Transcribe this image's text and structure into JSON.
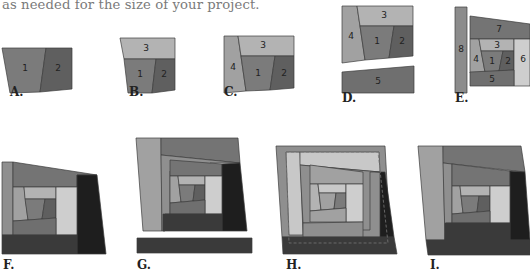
{
  "intro_text": "as needed for the size of your project.",
  "colors": {
    "p1": "#7b7b7b",
    "p2": "#5f5f5f",
    "p3": "#b3b3b3",
    "p4": "#a1a1a1",
    "p5": "#6f6f6f",
    "p6": "#cecece",
    "p7": "#747474",
    "p8": "#8c8c8c",
    "light": "#c8c8c8",
    "mid": "#8f8f8f",
    "dark": "#3a3a3a",
    "darker": "#1e1e1e",
    "edge": "#3c3c3c"
  },
  "figures": [
    {
      "id": "A",
      "label": "A.",
      "label_x": 10,
      "label_y": 97,
      "shapes": [
        {
          "pts": "2,48 46,48 40,92 10,93",
          "fill": "p1",
          "num": "1",
          "nx": 25,
          "ny": 71
        },
        {
          "pts": "46,48 72,48 72,89 40,92",
          "fill": "p2",
          "num": "2",
          "nx": 58,
          "ny": 71
        }
      ]
    },
    {
      "id": "B",
      "label": "B.",
      "label_x": 129,
      "label_y": 97,
      "shapes": [
        {
          "pts": "120,38 175,38 175,59 124,59",
          "fill": "p3",
          "num": "3",
          "nx": 146,
          "ny": 51
        },
        {
          "pts": "124,59 156,59 152,93 128,93",
          "fill": "p1",
          "num": "1",
          "nx": 140,
          "ny": 77
        },
        {
          "pts": "156,59 175,59 175,90 152,93",
          "fill": "p2",
          "num": "2",
          "nx": 164,
          "ny": 77
        }
      ]
    },
    {
      "id": "C",
      "label": "C.",
      "label_x": 224,
      "label_y": 97,
      "shapes": [
        {
          "pts": "224,36 238,36 246,91 224,93",
          "fill": "p4",
          "num": "4",
          "nx": 233,
          "ny": 70
        },
        {
          "pts": "238,36 294,36 294,56 241,56",
          "fill": "p3",
          "num": "3",
          "nx": 263,
          "ny": 48
        },
        {
          "pts": "241,56 275,56 270,90 246,91",
          "fill": "p1",
          "num": "1",
          "nx": 258,
          "ny": 76
        },
        {
          "pts": "275,56 294,56 294,88 270,90",
          "fill": "p2",
          "num": "2",
          "nx": 284,
          "ny": 76
        }
      ]
    },
    {
      "id": "D",
      "label": "D.",
      "label_x": 342,
      "label_y": 103,
      "shapes": [
        {
          "pts": "342,6 357,6 365,60 342,63",
          "fill": "p4",
          "num": "4",
          "nx": 351,
          "ny": 39
        },
        {
          "pts": "357,6 413,6 413,26 360,26",
          "fill": "p3",
          "num": "3",
          "nx": 384,
          "ny": 18
        },
        {
          "pts": "360,26 394,26 389,58 365,60",
          "fill": "p1",
          "num": "1",
          "nx": 377,
          "ny": 44
        },
        {
          "pts": "394,26 413,26 413,56 389,58",
          "fill": "p2",
          "num": "2",
          "nx": 402,
          "ny": 44
        },
        {
          "pts": "342,72 414,66 414,93 342,93",
          "fill": "p5",
          "num": "5",
          "nx": 378,
          "ny": 84
        }
      ]
    },
    {
      "id": "E",
      "label": "E.",
      "label_x": 455,
      "label_y": 103,
      "shapes": [
        {
          "pts": "455,7 467,7 467,93 455,93",
          "fill": "p8",
          "num": "8",
          "nx": 461,
          "ny": 52
        },
        {
          "pts": "470,16 530,24 530,39 470,39",
          "fill": "p7",
          "num": "7",
          "nx": 499,
          "ny": 32
        },
        {
          "pts": "470,39 479,39 485,72 470,73",
          "fill": "p4",
          "num": "4",
          "nx": 476,
          "ny": 62
        },
        {
          "pts": "479,39 514,39 514,51 481,51",
          "fill": "p3",
          "num": "3",
          "nx": 497,
          "ny": 48
        },
        {
          "pts": "481,51 503,51 499,71 485,72",
          "fill": "p1",
          "num": "1",
          "nx": 492,
          "ny": 64
        },
        {
          "pts": "503,51 514,51 514,70 499,71",
          "fill": "p2",
          "num": "2",
          "nx": 508,
          "ny": 64
        },
        {
          "pts": "514,39 530,39 530,86 514,86",
          "fill": "p6",
          "num": "6",
          "nx": 523,
          "ny": 62
        },
        {
          "pts": "470,72 514,70 514,86 470,86",
          "fill": "p5",
          "num": "5",
          "nx": 492,
          "ny": 82
        }
      ]
    },
    {
      "id": "F",
      "label": "F.",
      "label_x": 3,
      "label_y": 270,
      "shapes": [
        {
          "pts": "2,162 13,162 13,235 2,235",
          "fill": "mid"
        },
        {
          "pts": "13,162 97,175 77,175 77,187 13,187",
          "fill": "p7"
        },
        {
          "pts": "77,175 97,175 106,254 77,254",
          "fill": "darker"
        },
        {
          "pts": "13,187 24,187 28,220 13,221",
          "fill": "p4"
        },
        {
          "pts": "24,187 56,187 56,199 25,199",
          "fill": "p3"
        },
        {
          "pts": "25,199 45,199 42,219 28,220",
          "fill": "p1"
        },
        {
          "pts": "45,199 56,199 56,218 42,219",
          "fill": "p2"
        },
        {
          "pts": "56,187 77,187 77,235 56,235",
          "fill": "p6"
        },
        {
          "pts": "13,221 56,218 56,235 13,235",
          "fill": "p5"
        },
        {
          "pts": "2,235 77,235 77,254 2,254",
          "fill": "dark"
        }
      ]
    },
    {
      "id": "G",
      "label": "G.",
      "label_x": 137,
      "label_y": 270,
      "shapes": [
        {
          "pts": "136,138 161,138 162,231 143,231",
          "fill": "p4"
        },
        {
          "pts": "161,138 238,138 240,163 161,155",
          "fill": "p7"
        },
        {
          "pts": "161,155 240,163 210,163 210,171 170,171 170,214 165,214 165,231 162,231",
          "fill": "mid"
        },
        {
          "pts": "170,160 222,164 222,176 170,176",
          "fill": "p7"
        },
        {
          "pts": "222,164 240,163 247,231 222,231",
          "fill": "darker"
        },
        {
          "pts": "170,176 178,176 181,202 170,203",
          "fill": "p4"
        },
        {
          "pts": "178,176 205,176 205,185 179,185",
          "fill": "p3"
        },
        {
          "pts": "179,185 195,185 193,201 181,202",
          "fill": "p1"
        },
        {
          "pts": "195,185 205,185 205,200 193,201",
          "fill": "p2"
        },
        {
          "pts": "205,176 222,176 222,214 205,214",
          "fill": "p6"
        },
        {
          "pts": "170,203 205,200 205,214 170,214",
          "fill": "p5"
        },
        {
          "pts": "163,214 222,214 222,231 163,231",
          "fill": "dark"
        },
        {
          "pts": "137,238 252,238 252,253 137,253",
          "fill": "dark"
        }
      ]
    },
    {
      "id": "H",
      "label": "H.",
      "label_x": 286,
      "label_y": 270,
      "shapes": [
        {
          "pts": "276,146 385,146 390,237 282,237",
          "fill": "mid"
        },
        {
          "pts": "286,152 300,152 303,235 289,235",
          "fill": "light"
        },
        {
          "pts": "300,152 379,152 380,172 300,165",
          "fill": "light"
        },
        {
          "pts": "300,165 380,172 370,172 370,230 310,230 310,223 303,223",
          "fill": "mid"
        },
        {
          "pts": "310,165 363,172 363,184 310,184",
          "fill": "p4"
        },
        {
          "pts": "310,184 318,184 321,210 310,211",
          "fill": "p3"
        },
        {
          "pts": "318,184 346,184 346,193 319,193",
          "fill": "light"
        },
        {
          "pts": "319,193 336,193 334,209 321,210",
          "fill": "p4"
        },
        {
          "pts": "336,193 346,193 346,208 334,209",
          "fill": "p1"
        },
        {
          "pts": "346,184 363,184 363,222 346,222",
          "fill": "p6"
        },
        {
          "pts": "310,211 346,208 346,222 310,222",
          "fill": "p4"
        },
        {
          "pts": "303,223 363,222 363,237 303,237",
          "fill": "mid"
        },
        {
          "pts": "380,172 385,172 394,237 380,237",
          "fill": "darker"
        },
        {
          "pts": "282,237 394,237 397,254 283,254",
          "fill": "dark"
        }
      ],
      "dashed": "286,152 378,152 388,243 289,243"
    },
    {
      "id": "I",
      "label": "I.",
      "label_x": 430,
      "label_y": 270,
      "shapes": [
        {
          "pts": "418,146 443,146 445,240 426,240",
          "fill": "p4"
        },
        {
          "pts": "443,146 521,146 525,172 443,163",
          "fill": "p7"
        },
        {
          "pts": "443,163 452,164 452,223 446,223 445,240",
          "fill": "mid"
        },
        {
          "pts": "452,164 510,171 510,186 452,186",
          "fill": "p7"
        },
        {
          "pts": "510,171 525,172 530,240 510,240",
          "fill": "darker"
        },
        {
          "pts": "452,186 460,186 463,213 452,214",
          "fill": "p4"
        },
        {
          "pts": "460,186 490,186 490,196 461,196",
          "fill": "p3"
        },
        {
          "pts": "461,196 479,196 477,212 463,213",
          "fill": "p1"
        },
        {
          "pts": "479,196 490,196 490,211 477,212",
          "fill": "p2"
        },
        {
          "pts": "490,186 510,186 510,223 490,223",
          "fill": "p6"
        },
        {
          "pts": "452,214 490,211 490,223 452,223",
          "fill": "p5"
        },
        {
          "pts": "445,223 510,223 510,240 445,240",
          "fill": "dark"
        },
        {
          "pts": "426,240 530,240 530,255 428,255",
          "fill": "dark"
        }
      ]
    }
  ]
}
